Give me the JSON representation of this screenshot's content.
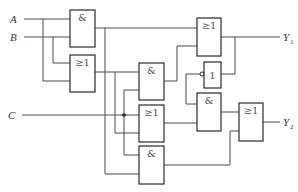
{
  "diagram": {
    "type": "logic-circuit",
    "inputs": [
      {
        "id": "A",
        "label": "A"
      },
      {
        "id": "B",
        "label": "B"
      },
      {
        "id": "C",
        "label": "C"
      }
    ],
    "outputs": [
      {
        "id": "Y1",
        "label": "Y",
        "subscript": "1"
      },
      {
        "id": "Y2",
        "label": "Y",
        "subscript": "2"
      }
    ],
    "gates": [
      {
        "id": "g1",
        "symbol": "&",
        "type": "AND"
      },
      {
        "id": "g2",
        "symbol": "≥1",
        "type": "OR"
      },
      {
        "id": "g3",
        "symbol": "&",
        "type": "AND"
      },
      {
        "id": "g4",
        "symbol": "≥1",
        "type": "OR"
      },
      {
        "id": "g5",
        "symbol": "&",
        "type": "AND"
      },
      {
        "id": "g6",
        "symbol": "≥1",
        "type": "OR"
      },
      {
        "id": "g7",
        "symbol": "1",
        "type": "NOT"
      },
      {
        "id": "g8",
        "symbol": "&",
        "type": "AND"
      },
      {
        "id": "g9",
        "symbol": "≥1",
        "type": "OR"
      }
    ]
  }
}
